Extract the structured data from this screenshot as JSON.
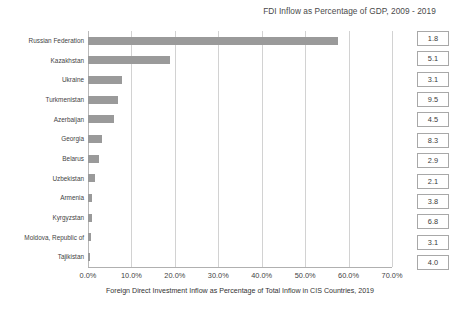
{
  "chart_data": {
    "type": "bar",
    "orientation": "horizontal",
    "title": "FDI Inflow as Percentage of GDP, 2009 - 2019",
    "xlabel": "Foreign Direct Investment Inflow as Percentage of Total Inflow in CIS Countries, 2019",
    "ylabel": "",
    "xlim": [
      0,
      70
    ],
    "grid": true,
    "legend": false,
    "bar_color": "#9a9a9a",
    "gridline_color": "#d2d2d2",
    "categories": [
      "Russian Federation",
      "Kazakhstan",
      "Ukraine",
      "Turkmenistan",
      "Azerbaijan",
      "Georgia",
      "Belarus",
      "Uzbekistan",
      "Armenia",
      "Kyrgyzstan",
      "Moldova, Republic of",
      "Tajikistan"
    ],
    "values": [
      57.5,
      18.8,
      7.8,
      6.9,
      6.0,
      3.2,
      2.6,
      1.5,
      1.0,
      0.9,
      0.7,
      0.4
    ],
    "xticks": [
      0,
      10,
      20,
      30,
      40,
      50,
      60,
      70
    ],
    "xtick_labels": [
      "0.0%",
      "10.0%",
      "20.0%",
      "30.0%",
      "40.0%",
      "50.0%",
      "60.0%",
      "70.0%"
    ],
    "annotations": {
      "label": "FDI Inflow as Percentage of GDP, 2009 - 2019",
      "values": [
        "1.8",
        "5.1",
        "3.1",
        "9.5",
        "4.5",
        "8.3",
        "2.9",
        "2.1",
        "3.8",
        "6.8",
        "3.1",
        "4.0"
      ]
    }
  }
}
